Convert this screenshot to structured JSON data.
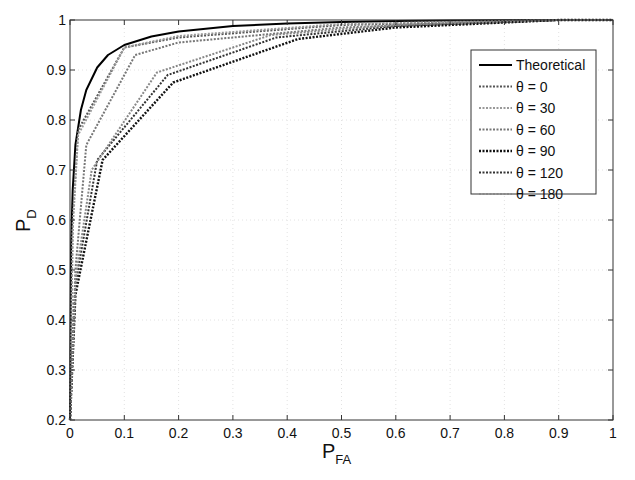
{
  "chart_data": {
    "type": "line",
    "title": "",
    "xlabel": "P",
    "xlabel_sub": "FA",
    "ylabel": "P",
    "ylabel_sub": "D",
    "xlim": [
      0,
      1
    ],
    "ylim": [
      0.2,
      1
    ],
    "grid": true,
    "legend_position": "upper-right",
    "x_ticks": [
      "0",
      "0.1",
      "0.2",
      "0.3",
      "0.4",
      "0.5",
      "0.6",
      "0.7",
      "0.8",
      "0.9",
      "1"
    ],
    "y_ticks": [
      "0.2",
      "0.3",
      "0.4",
      "0.5",
      "0.6",
      "0.7",
      "0.8",
      "0.9",
      "1"
    ],
    "series": [
      {
        "name": "Theoretical",
        "style": "solid",
        "color": "#000000",
        "width": 2,
        "x": [
          0,
          0.002,
          0.005,
          0.01,
          0.02,
          0.03,
          0.05,
          0.07,
          0.1,
          0.15,
          0.2,
          0.3,
          0.4,
          0.5,
          0.6,
          0.7,
          0.8,
          0.9,
          1.0
        ],
        "y": [
          0.2,
          0.55,
          0.66,
          0.75,
          0.82,
          0.86,
          0.905,
          0.93,
          0.95,
          0.967,
          0.977,
          0.988,
          0.993,
          0.996,
          0.998,
          0.999,
          0.9995,
          1.0,
          1.0
        ]
      },
      {
        "name": "θ = 0",
        "style": "dotted",
        "color": "#555555",
        "width": 2,
        "x": [
          0,
          0.005,
          0.015,
          0.1,
          0.2,
          0.5,
          0.9,
          1.0
        ],
        "y": [
          0.2,
          0.6,
          0.78,
          0.945,
          0.965,
          0.99,
          1.0,
          1.0
        ]
      },
      {
        "name": "θ = 30",
        "style": "dotted",
        "color": "#999999",
        "width": 2,
        "x": [
          0,
          0.005,
          0.015,
          0.1,
          0.2,
          0.5,
          0.9,
          1.0
        ],
        "y": [
          0.2,
          0.58,
          0.77,
          0.945,
          0.968,
          0.992,
          1.0,
          1.0
        ]
      },
      {
        "name": "θ = 60",
        "style": "dotted",
        "color": "#777777",
        "width": 2,
        "x": [
          0,
          0.01,
          0.03,
          0.12,
          0.2,
          0.5,
          0.9,
          1.0
        ],
        "y": [
          0.2,
          0.5,
          0.75,
          0.93,
          0.955,
          0.985,
          1.0,
          1.0
        ]
      },
      {
        "name": "θ = 90",
        "style": "dotted",
        "color": "#111111",
        "width": 2.4,
        "x": [
          0,
          0.01,
          0.06,
          0.19,
          0.42,
          0.6,
          0.9,
          1.0
        ],
        "y": [
          0.2,
          0.45,
          0.72,
          0.875,
          0.962,
          0.985,
          1.0,
          1.0
        ]
      },
      {
        "name": "θ = 120",
        "style": "dotted",
        "color": "#333333",
        "width": 2,
        "x": [
          0,
          0.01,
          0.05,
          0.18,
          0.38,
          0.6,
          0.9,
          1.0
        ],
        "y": [
          0.2,
          0.47,
          0.72,
          0.89,
          0.965,
          0.988,
          1.0,
          1.0
        ]
      },
      {
        "name": "θ = 180",
        "style": "dotted",
        "color": "#888888",
        "width": 2,
        "x": [
          0,
          0.01,
          0.04,
          0.16,
          0.37,
          0.6,
          0.9,
          1.0
        ],
        "y": [
          0.2,
          0.48,
          0.7,
          0.895,
          0.97,
          0.99,
          1.0,
          1.0
        ]
      }
    ]
  }
}
